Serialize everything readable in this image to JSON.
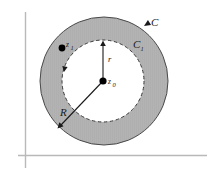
{
  "figure": {
    "background_color": "#ffffff",
    "width": 213,
    "height": 178
  },
  "axes": {
    "color": "#b9b9b9",
    "vertical_axis_name": "imaginary-axis",
    "horizontal_axis_name": "real-axis"
  },
  "colors": {
    "annulus_fill": "#b3b3b3",
    "inner_fill": "#ffffff",
    "stroke": "#3c3c3c",
    "axis": "#b9b9b9",
    "point": "#000000"
  },
  "regions": {
    "annulus": {
      "name": "shaded-annulus",
      "center": [
        104,
        81
      ],
      "outer_radius": 64,
      "inner_radius": 41,
      "fill": "#b3b3b3"
    },
    "inner_disk": {
      "name": "inner-white-disk",
      "fill": "#ffffff"
    }
  },
  "contours": {
    "outer": {
      "label": "C",
      "style": "solid",
      "orientation": "clockwise",
      "label_position": [
        152,
        24
      ]
    },
    "inner": {
      "label": "C",
      "sub": "1",
      "style": "dashed",
      "orientation": "clockwise",
      "label_position": [
        134,
        47
      ]
    }
  },
  "points": [
    {
      "name": "point-z1",
      "label": "z",
      "sub": "1",
      "x": 62,
      "y": 48,
      "label_x": 67,
      "label_y": 46
    },
    {
      "name": "point-z0",
      "label": "z",
      "sub": "0",
      "x": 103,
      "y": 81,
      "label_x": 108,
      "label_y": 83
    }
  ],
  "radii": [
    {
      "name": "inner-radius-r",
      "label": "r",
      "from": [
        103,
        81
      ],
      "to": [
        103,
        41
      ],
      "label_x": 109,
      "label_y": 60
    },
    {
      "name": "outer-radius-R",
      "label": "R",
      "from": [
        103,
        81
      ],
      "to": [
        59,
        128
      ],
      "label_x": 63,
      "label_y": 113
    }
  ],
  "arrowheads": [
    {
      "name": "outer-contour-arrowhead",
      "x": 142,
      "y": 26,
      "angle": 118
    },
    {
      "name": "inner-contour-arrowhead",
      "x": 64,
      "y": 70,
      "angle": 108
    },
    {
      "name": "radius-r-arrowhead",
      "x": 103,
      "y": 41,
      "angle": -90
    },
    {
      "name": "radius-R-arrowhead",
      "x": 59,
      "y": 128,
      "angle": 133
    }
  ]
}
